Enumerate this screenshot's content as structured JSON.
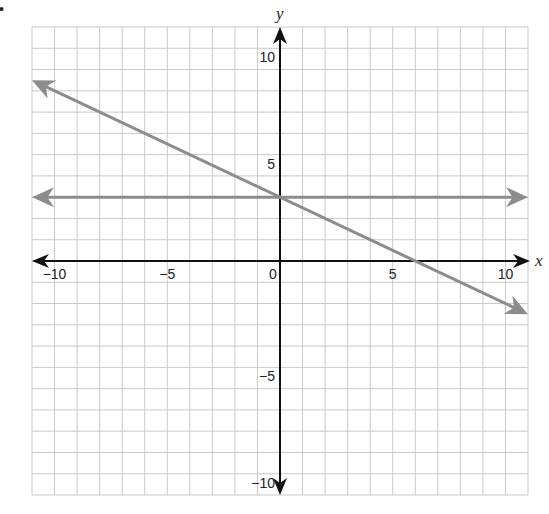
{
  "chart_data": {
    "type": "line",
    "title": "",
    "xlabel": "x",
    "ylabel": "y",
    "xlim": [
      -11,
      11
    ],
    "ylim": [
      -11,
      11
    ],
    "grid": true,
    "grid_step": 1,
    "x_ticks": [
      {
        "value": -10,
        "label": "−10"
      },
      {
        "value": -5,
        "label": "−5"
      },
      {
        "value": 0,
        "label": "0"
      },
      {
        "value": 5,
        "label": "5"
      },
      {
        "value": 10,
        "label": "10"
      }
    ],
    "y_ticks": [
      {
        "value": 10,
        "label": "10"
      },
      {
        "value": 5,
        "label": "5"
      },
      {
        "value": -5,
        "label": "−5"
      },
      {
        "value": -10,
        "label": "−10"
      }
    ],
    "series": [
      {
        "name": "horizontal line y = 3",
        "equation": "y = 3",
        "points": [
          [
            -11,
            3
          ],
          [
            11,
            3
          ]
        ],
        "arrows": "both",
        "color": "#8c8c8c"
      },
      {
        "name": "slanted line y = -x/2 + 3",
        "equation": "y = -0.5x + 3",
        "points": [
          [
            -11,
            8.5
          ],
          [
            11,
            -2.5
          ]
        ],
        "y_intercept": 3,
        "x_intercept": 6,
        "arrows": "both",
        "color": "#8c8c8c"
      }
    ]
  },
  "labels": {
    "x_axis": "x",
    "y_axis": "y",
    "bullet": "•"
  },
  "colors": {
    "grid": "#c9c9c9",
    "axis": "#111111",
    "series": "#8c8c8c"
  }
}
